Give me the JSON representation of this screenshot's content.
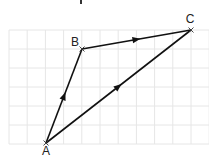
{
  "diagram": {
    "title_fragment": "",
    "grid": {
      "origin_px": [
        9,
        30
      ],
      "cell_w": 18.2,
      "cell_h": 19,
      "cols": 11,
      "rows": 6,
      "line_color": "#e6e6e6"
    },
    "points": [
      {
        "id": "A",
        "label": "A",
        "grid": [
          2,
          6
        ],
        "px": [
          46,
          143
        ],
        "label_px": [
          46,
          155
        ]
      },
      {
        "id": "B",
        "label": "B",
        "grid": [
          4,
          1
        ],
        "px": [
          82,
          49
        ],
        "label_px": [
          75,
          46
        ]
      },
      {
        "id": "C",
        "label": "C",
        "grid": [
          10,
          0
        ],
        "px": [
          191,
          30
        ],
        "label_px": [
          190,
          23
        ]
      }
    ],
    "vectors": [
      {
        "from": "A",
        "to": "B",
        "arrow_at": "midpoint"
      },
      {
        "from": "B",
        "to": "C",
        "arrow_at": "midpoint"
      },
      {
        "from": "A",
        "to": "C",
        "arrow_at": "midpoint"
      }
    ],
    "stroke_color": "#111111"
  }
}
